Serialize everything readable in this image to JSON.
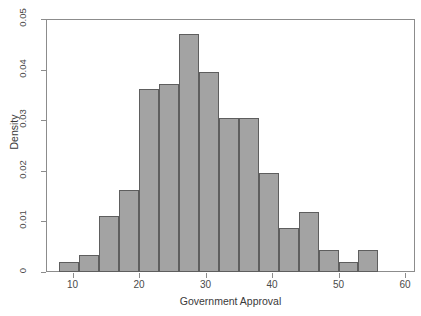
{
  "chart_data": {
    "type": "bar",
    "title": "",
    "xlabel": "Government Approval",
    "ylabel": "Density",
    "xlim": [
      6,
      61.5
    ],
    "ylim": [
      0,
      0.05
    ],
    "grid": false,
    "legend": null,
    "bin_width": 3,
    "x_ticks": [
      "10",
      "20",
      "30",
      "40",
      "50",
      "60"
    ],
    "x_tick_values": [
      10,
      20,
      30,
      40,
      50,
      60
    ],
    "y_ticks": [
      "0",
      "0.01",
      "0.02",
      "0.03",
      "0.04",
      "0.05"
    ],
    "y_tick_values": [
      0,
      0.01,
      0.02,
      0.03,
      0.04,
      0.05
    ],
    "bar_color": "#a3a3a3",
    "bar_border_color": "#5e5e5e",
    "bins": [
      {
        "start": 8,
        "end": 11,
        "label": "8-11",
        "density": 0.002
      },
      {
        "start": 11,
        "end": 14,
        "label": "11-14",
        "density": 0.0033
      },
      {
        "start": 14,
        "end": 17,
        "label": "14-17",
        "density": 0.011
      },
      {
        "start": 17,
        "end": 20,
        "label": "17-20",
        "density": 0.0163
      },
      {
        "start": 20,
        "end": 23,
        "label": "20-23",
        "density": 0.0362
      },
      {
        "start": 23,
        "end": 26,
        "label": "23-26",
        "density": 0.0372
      },
      {
        "start": 26,
        "end": 29,
        "label": "26-29",
        "density": 0.047
      },
      {
        "start": 29,
        "end": 32,
        "label": "29-32",
        "density": 0.0395
      },
      {
        "start": 32,
        "end": 35,
        "label": "32-35",
        "density": 0.0305
      },
      {
        "start": 35,
        "end": 38,
        "label": "35-38",
        "density": 0.0305
      },
      {
        "start": 38,
        "end": 41,
        "label": "38-41",
        "density": 0.0195
      },
      {
        "start": 41,
        "end": 44,
        "label": "41-44",
        "density": 0.0087
      },
      {
        "start": 44,
        "end": 47,
        "label": "44-47",
        "density": 0.0119
      },
      {
        "start": 47,
        "end": 50,
        "label": "47-50",
        "density": 0.0044
      },
      {
        "start": 50,
        "end": 53,
        "label": "50-53",
        "density": 0.002
      },
      {
        "start": 53,
        "end": 56,
        "label": "53-56",
        "density": 0.0044
      }
    ],
    "categories": [
      "8-11",
      "11-14",
      "14-17",
      "17-20",
      "20-23",
      "23-26",
      "26-29",
      "29-32",
      "32-35",
      "35-38",
      "38-41",
      "41-44",
      "44-47",
      "47-50",
      "50-53",
      "53-56"
    ],
    "values": [
      0.002,
      0.0033,
      0.011,
      0.0163,
      0.0362,
      0.0372,
      0.047,
      0.0395,
      0.0305,
      0.0305,
      0.0195,
      0.0087,
      0.0119,
      0.0044,
      0.002,
      0.0044
    ]
  }
}
